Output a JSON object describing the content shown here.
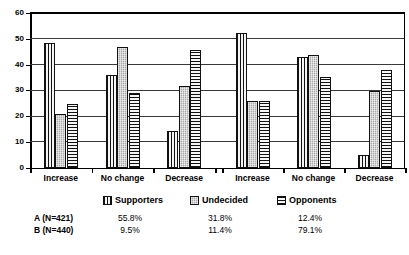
{
  "chart_data": {
    "type": "bar",
    "title": "",
    "xlabel": "",
    "ylabel": "",
    "ylim": [
      0,
      60
    ],
    "yticks": [
      0,
      10,
      20,
      30,
      40,
      50,
      60
    ],
    "grid": true,
    "legend_position": "bottom",
    "panels": [
      {
        "name": "A",
        "categories": [
          "Increase",
          "No change",
          "Decrease"
        ],
        "series": [
          {
            "name": "Supporters",
            "pattern": "vertical-stripes",
            "values": [
              48.5,
              36.0,
              14.5
            ]
          },
          {
            "name": "Undecided",
            "pattern": "gray-dotted",
            "values": [
              21.0,
              47.0,
              32.0
            ]
          },
          {
            "name": "Opponents",
            "pattern": "horizontal-stripes",
            "values": [
              25.0,
              29.0,
              46.0
            ]
          }
        ]
      },
      {
        "name": "B",
        "categories": [
          "Increase",
          "No change",
          "Decrease"
        ],
        "series": [
          {
            "name": "Supporters",
            "pattern": "vertical-stripes",
            "values": [
              52.5,
              43.0,
              5.0
            ]
          },
          {
            "name": "Undecided",
            "pattern": "gray-dotted",
            "values": [
              26.0,
              44.0,
              30.0
            ]
          },
          {
            "name": "Opponents",
            "pattern": "horizontal-stripes",
            "values": [
              26.0,
              35.5,
              38.0
            ]
          }
        ]
      }
    ],
    "legend": [
      {
        "label": "Supporters",
        "pattern": "vertical-stripes"
      },
      {
        "label": "Undecided",
        "pattern": "gray-dotted"
      },
      {
        "label": "Opponents",
        "pattern": "horizontal-stripes"
      }
    ],
    "table": {
      "columns": [
        "",
        "Supporters",
        "Undecided",
        "Opponents"
      ],
      "rows": [
        {
          "label": "A (N=421)",
          "values": [
            "55.8%",
            "31.8%",
            "12.4%"
          ]
        },
        {
          "label": "B (N=440)",
          "values": [
            "9.5%",
            "11.4%",
            "79.1%"
          ]
        }
      ]
    }
  }
}
